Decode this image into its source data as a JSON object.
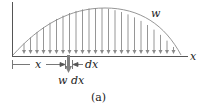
{
  "diagram": {
    "labels": {
      "load_intensity": "w",
      "x_axis": "x",
      "position": "x",
      "element_width": "dx",
      "element_force": "w dx",
      "caption": "(a)"
    },
    "colors": {
      "axis": "#555555",
      "arrows": "#8a8a8a",
      "curve": "#8a8a8a",
      "highlight_arrow": "#808080",
      "text": "#222222"
    }
  }
}
